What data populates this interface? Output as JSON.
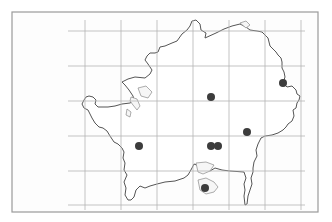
{
  "map": {
    "type": "distribution-map",
    "frame": {
      "x": 12,
      "y": 12,
      "width": 306,
      "height": 200
    },
    "colors": {
      "border": "#555555",
      "grid": "#b4b4b4",
      "dot": "#3c3c3c",
      "frame": "#9a9a9a"
    },
    "grid": {
      "vertical_x": [
        85,
        121,
        157,
        193,
        229,
        265,
        301
      ],
      "horizontal_y": [
        31,
        66,
        101,
        136,
        171,
        205
      ]
    },
    "records": [
      {
        "x": 283,
        "y": 83
      },
      {
        "x": 211,
        "y": 97
      },
      {
        "x": 247,
        "y": 132
      },
      {
        "x": 139,
        "y": 146
      },
      {
        "x": 211,
        "y": 146
      },
      {
        "x": 218,
        "y": 146
      },
      {
        "x": 205,
        "y": 188
      }
    ]
  }
}
